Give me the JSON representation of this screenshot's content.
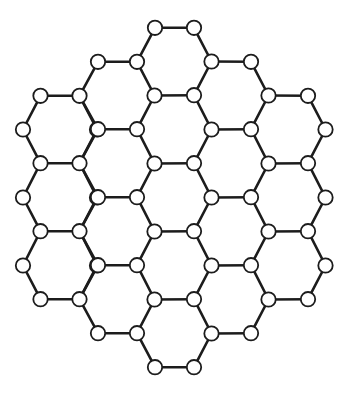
{
  "diagram": {
    "type": "hexagonal-lattice",
    "hexagon_count": 19,
    "geometry": {
      "inner_dx": 19.5,
      "outer_dx": 37,
      "half_height": 33.7,
      "node_radius": 7.2
    },
    "colors": {
      "background": "#ffffff",
      "bond": "#1c1c1c",
      "node_fill": "#ffffff",
      "node_stroke": "#1c1c1c"
    },
    "hex_centers": [
      {
        "x": 60,
        "y": 129.5
      },
      {
        "x": 60,
        "y": 197.5
      },
      {
        "x": 60,
        "y": 265.5
      },
      {
        "x": 117.5,
        "y": 95.5
      },
      {
        "x": 117.5,
        "y": 163.5
      },
      {
        "x": 117.5,
        "y": 231.5
      },
      {
        "x": 117.5,
        "y": 299.5
      },
      {
        "x": 174.5,
        "y": 61.5
      },
      {
        "x": 174.5,
        "y": 129.5
      },
      {
        "x": 174.5,
        "y": 197.5
      },
      {
        "x": 174.5,
        "y": 265.5
      },
      {
        "x": 174.5,
        "y": 333.5
      },
      {
        "x": 231.5,
        "y": 95.5
      },
      {
        "x": 231.5,
        "y": 163.5
      },
      {
        "x": 231.5,
        "y": 231.5
      },
      {
        "x": 231.5,
        "y": 299.5
      },
      {
        "x": 288.5,
        "y": 129.5
      },
      {
        "x": 288.5,
        "y": 197.5
      },
      {
        "x": 288.5,
        "y": 265.5
      }
    ]
  }
}
